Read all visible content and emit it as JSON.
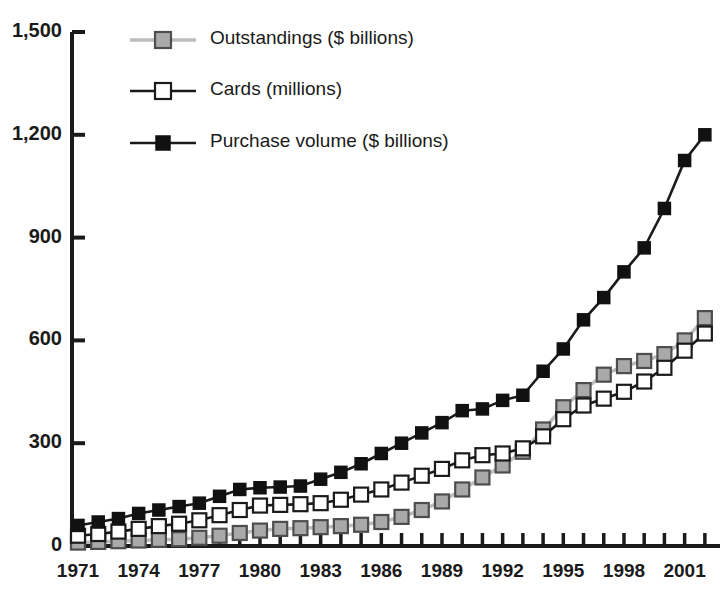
{
  "chart_data": {
    "type": "line",
    "title": "",
    "xlabel": "",
    "ylabel": "",
    "ylim": [
      0,
      1500
    ],
    "yticks": [
      0,
      300,
      600,
      900,
      1200,
      1500
    ],
    "ytick_labels": [
      "0",
      "300",
      "600",
      "900",
      "1,200",
      "1,500"
    ],
    "grid": false,
    "legend_position": "top-left",
    "x": [
      1971,
      1972,
      1973,
      1974,
      1975,
      1976,
      1977,
      1978,
      1979,
      1980,
      1981,
      1982,
      1983,
      1984,
      1985,
      1986,
      1987,
      1988,
      1989,
      1990,
      1991,
      1992,
      1993,
      1994,
      1995,
      1996,
      1997,
      1998,
      1999,
      2000,
      2001,
      2002
    ],
    "xtick_labels": [
      "1971",
      "1974",
      "1977",
      "1980",
      "1983",
      "1986",
      "1989",
      "1992",
      "1995",
      "1998",
      "2001"
    ],
    "xtick_values": [
      1971,
      1974,
      1977,
      1980,
      1983,
      1986,
      1989,
      1992,
      1995,
      1998,
      2001
    ],
    "series": [
      {
        "name": "Outstandings ($ billions)",
        "marker": "filled-gray-square",
        "line_color": "#bdbdbd",
        "marker_fill": "#a9a9a9",
        "marker_edge": "#4d4d4d",
        "values": [
          10,
          12,
          14,
          16,
          18,
          20,
          24,
          30,
          38,
          45,
          50,
          52,
          55,
          58,
          62,
          70,
          85,
          105,
          130,
          165,
          200,
          235,
          275,
          340,
          405,
          455,
          500,
          525,
          540,
          560,
          600,
          665
        ]
      },
      {
        "name": "Cards (millions)",
        "marker": "open-white-square",
        "line_color": "#1a1a1a",
        "marker_fill": "#ffffff",
        "marker_edge": "#1a1a1a",
        "values": [
          30,
          35,
          42,
          50,
          58,
          65,
          75,
          90,
          105,
          118,
          120,
          122,
          125,
          135,
          150,
          165,
          185,
          205,
          225,
          250,
          265,
          270,
          285,
          320,
          370,
          410,
          430,
          450,
          480,
          520,
          570,
          620
        ]
      },
      {
        "name": "Purchase volume ($ billions)",
        "marker": "filled-black-square",
        "line_color": "#1a1a1a",
        "marker_fill": "#111111",
        "marker_edge": "#111111",
        "values": [
          60,
          70,
          80,
          95,
          105,
          115,
          125,
          145,
          165,
          170,
          172,
          175,
          195,
          215,
          240,
          270,
          300,
          330,
          360,
          395,
          400,
          425,
          440,
          510,
          575,
          660,
          725,
          800,
          870,
          985,
          1125,
          1200
        ]
      }
    ]
  },
  "axis": {
    "y_tick_labels": [
      "1,500",
      "1,200",
      "900",
      "600",
      "300",
      "0"
    ],
    "x_tick_labels": [
      "1971",
      "1974",
      "1977",
      "1980",
      "1983",
      "1986",
      "1989",
      "1992",
      "1995",
      "1998",
      "2001"
    ]
  },
  "legend": {
    "items": [
      {
        "label": "Outstandings ($ billions)"
      },
      {
        "label": "Cards (millions)"
      },
      {
        "label": "Purchase volume ($ billions)"
      }
    ]
  }
}
